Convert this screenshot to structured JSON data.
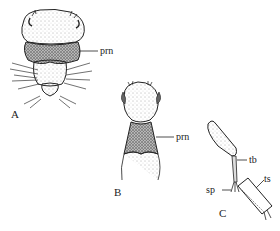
{
  "figure": {
    "panels": [
      {
        "id": "A",
        "label": "A",
        "annotations": [
          {
            "text": "prn"
          }
        ]
      },
      {
        "id": "B",
        "label": "B",
        "annotations": [
          {
            "text": "prn"
          }
        ]
      },
      {
        "id": "C",
        "label": "C",
        "annotations": [
          {
            "text": "tb"
          },
          {
            "text": "ts"
          },
          {
            "text": "sp"
          }
        ]
      }
    ],
    "colors": {
      "ink": "#222222",
      "background": "#ffffff"
    }
  }
}
